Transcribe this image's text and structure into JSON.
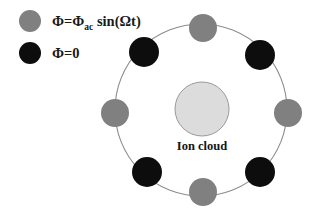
{
  "figure": {
    "background_color": "#ffffff"
  },
  "colors": {
    "ac_electrode": "#808080",
    "ground_electrode": "#0d0d0d",
    "ion_cloud_fill": "#dcdcdc",
    "ion_cloud_stroke": "#9a9a9a",
    "ring_stroke": "#8c8c8c",
    "text": "#141414"
  },
  "legend": {
    "items": [
      {
        "marker": "gray-circle",
        "marker_color": "#808080",
        "marker_cx": 30,
        "marker_cy": 21,
        "marker_r": 11,
        "text_x": 52,
        "text_y": 26,
        "parts": [
          {
            "text": "Φ=Φ",
            "style": "main"
          },
          {
            "text": "ac",
            "style": "sub"
          },
          {
            "text": " sin(Ωt)",
            "style": "main"
          }
        ],
        "plain_text": "Φ=Φac sin(Ωt)"
      },
      {
        "marker": "black-circle",
        "marker_color": "#0d0d0d",
        "marker_cx": 30,
        "marker_cy": 53,
        "marker_r": 11,
        "text_x": 52,
        "text_y": 58,
        "parts": [
          {
            "text": "Φ=0",
            "style": "main"
          }
        ],
        "plain_text": "Φ=0"
      }
    ]
  },
  "ring": {
    "center_x": 201,
    "center_y": 110,
    "radius": 86,
    "stroke_width": 1.1
  },
  "ion_cloud": {
    "center_x": 202,
    "center_y": 109,
    "radius": 27,
    "label": "Ion cloud",
    "label_x": 202,
    "label_y": 150
  },
  "electrodes": [
    {
      "id": "electrode-top",
      "type": "ac",
      "angle_deg": 270,
      "cx": 203,
      "cy": 28,
      "r": 14,
      "color": "#808080"
    },
    {
      "id": "electrode-upper-right",
      "type": "ground",
      "angle_deg": 315,
      "cx": 260,
      "cy": 55,
      "r": 15,
      "color": "#0d0d0d"
    },
    {
      "id": "electrode-right",
      "type": "ac",
      "angle_deg": 0,
      "cx": 288,
      "cy": 113,
      "r": 14,
      "color": "#808080"
    },
    {
      "id": "electrode-lower-right",
      "type": "ground",
      "angle_deg": 45,
      "cx": 260,
      "cy": 172,
      "r": 15,
      "color": "#0d0d0d"
    },
    {
      "id": "electrode-bottom",
      "type": "ac",
      "angle_deg": 90,
      "cx": 203,
      "cy": 192,
      "r": 14,
      "color": "#808080"
    },
    {
      "id": "electrode-lower-left",
      "type": "ground",
      "angle_deg": 135,
      "cx": 147,
      "cy": 172,
      "r": 15,
      "color": "#0d0d0d"
    },
    {
      "id": "electrode-left",
      "type": "ac",
      "angle_deg": 180,
      "cx": 115,
      "cy": 113,
      "r": 14,
      "color": "#808080"
    },
    {
      "id": "electrode-upper-left",
      "type": "ground",
      "angle_deg": 225,
      "cx": 144,
      "cy": 52,
      "r": 15,
      "color": "#0d0d0d"
    }
  ]
}
